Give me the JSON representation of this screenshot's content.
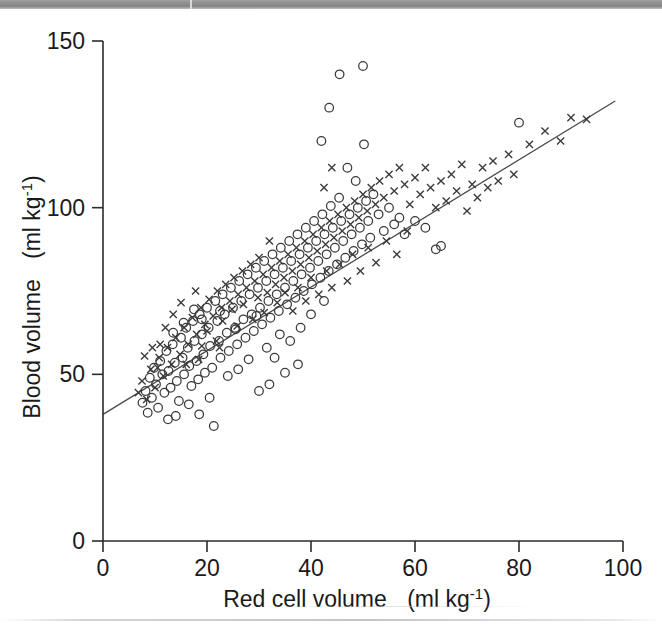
{
  "figure": {
    "background_color": "#ffffff",
    "ink_color": "#2b2b2b"
  },
  "chart_data": {
    "type": "scatter",
    "title": "",
    "xlabel": "Red cell volume",
    "xunits": "(ml kg⁻¹)",
    "ylabel": "Blood volume",
    "yunits": "(ml kg⁻¹)",
    "xlim": [
      0,
      100
    ],
    "ylim": [
      0,
      150
    ],
    "xticks": [
      0,
      20,
      40,
      60,
      80,
      100
    ],
    "yticks": [
      0,
      50,
      100,
      150
    ],
    "xticklabels": [
      "0",
      "20",
      "40",
      "60",
      "80",
      "100"
    ],
    "yticklabels": [
      "0",
      "50",
      "100",
      "150"
    ],
    "grid": false,
    "legend": "none",
    "fit_line": {
      "label": "regression line",
      "color": "#4a4a4a",
      "x_start": 0.0,
      "y_start": 38.0,
      "x_end": 98.5,
      "y_end": 132.0
    },
    "series": [
      {
        "name": "open-circle group",
        "marker": "o",
        "color": "#3a3a3a",
        "points": [
          [
            7.6,
            41.5
          ],
          [
            8.2,
            45.0
          ],
          [
            8.6,
            38.5
          ],
          [
            9.0,
            49.0
          ],
          [
            9.4,
            43.0
          ],
          [
            9.8,
            52.0
          ],
          [
            10.2,
            47.0
          ],
          [
            10.6,
            40.0
          ],
          [
            11.0,
            54.0
          ],
          [
            11.4,
            50.0
          ],
          [
            11.8,
            44.5
          ],
          [
            12.2,
            57.0
          ],
          [
            12.6,
            51.0
          ],
          [
            13.0,
            46.0
          ],
          [
            13.4,
            59.0
          ],
          [
            13.8,
            53.5
          ],
          [
            14.2,
            48.0
          ],
          [
            14.6,
            42.0
          ],
          [
            15.0,
            61.0
          ],
          [
            15.3,
            55.0
          ],
          [
            15.6,
            50.0
          ],
          [
            16.0,
            64.0
          ],
          [
            16.3,
            58.0
          ],
          [
            16.6,
            52.5
          ],
          [
            17.0,
            46.5
          ],
          [
            17.3,
            66.0
          ],
          [
            17.6,
            60.0
          ],
          [
            18.0,
            54.0
          ],
          [
            18.3,
            48.5
          ],
          [
            18.6,
            68.0
          ],
          [
            19.0,
            62.0
          ],
          [
            19.3,
            56.0
          ],
          [
            19.6,
            50.5
          ],
          [
            20.0,
            70.0
          ],
          [
            20.3,
            64.0
          ],
          [
            20.6,
            58.5
          ],
          [
            21.0,
            52.0
          ],
          [
            21.3,
            34.5
          ],
          [
            21.6,
            72.0
          ],
          [
            22.0,
            66.0
          ],
          [
            22.3,
            60.0
          ],
          [
            22.6,
            55.0
          ],
          [
            23.0,
            74.0
          ],
          [
            23.4,
            68.0
          ],
          [
            23.8,
            62.5
          ],
          [
            24.2,
            57.0
          ],
          [
            24.6,
            76.0
          ],
          [
            25.0,
            70.0
          ],
          [
            25.4,
            64.0
          ],
          [
            25.8,
            59.0
          ],
          [
            26.2,
            78.0
          ],
          [
            26.6,
            72.0
          ],
          [
            27.0,
            66.5
          ],
          [
            27.4,
            61.0
          ],
          [
            27.8,
            80.0
          ],
          [
            28.2,
            74.0
          ],
          [
            28.6,
            68.0
          ],
          [
            29.0,
            63.0
          ],
          [
            29.4,
            82.0
          ],
          [
            29.8,
            76.0
          ],
          [
            30.2,
            70.0
          ],
          [
            30.6,
            65.0
          ],
          [
            31.0,
            84.0
          ],
          [
            31.4,
            78.0
          ],
          [
            31.8,
            72.0
          ],
          [
            32.2,
            67.0
          ],
          [
            32.6,
            86.0
          ],
          [
            33.0,
            80.0
          ],
          [
            33.4,
            74.0
          ],
          [
            33.8,
            69.0
          ],
          [
            34.2,
            88.0
          ],
          [
            34.6,
            82.0
          ],
          [
            35.0,
            76.0
          ],
          [
            35.4,
            71.0
          ],
          [
            35.8,
            90.0
          ],
          [
            36.2,
            84.0
          ],
          [
            36.6,
            78.0
          ],
          [
            37.0,
            73.0
          ],
          [
            37.4,
            92.0
          ],
          [
            37.8,
            86.0
          ],
          [
            38.2,
            80.0
          ],
          [
            38.6,
            75.0
          ],
          [
            39.0,
            94.0
          ],
          [
            39.4,
            88.0
          ],
          [
            39.8,
            82.0
          ],
          [
            40.2,
            77.0
          ],
          [
            40.6,
            96.0
          ],
          [
            41.0,
            90.0
          ],
          [
            41.4,
            84.0
          ],
          [
            41.8,
            79.0
          ],
          [
            42.2,
            98.0
          ],
          [
            42.6,
            92.0
          ],
          [
            43.0,
            86.0
          ],
          [
            43.4,
            81.0
          ],
          [
            43.8,
            100.5
          ],
          [
            44.2,
            94.0
          ],
          [
            44.6,
            88.0
          ],
          [
            45.0,
            83.0
          ],
          [
            45.4,
            103.0
          ],
          [
            45.8,
            96.0
          ],
          [
            46.2,
            90.0
          ],
          [
            46.6,
            85.0
          ],
          [
            47.0,
            112.0
          ],
          [
            47.4,
            98.0
          ],
          [
            47.8,
            92.0
          ],
          [
            48.2,
            87.0
          ],
          [
            48.6,
            108.0
          ],
          [
            49.0,
            100.0
          ],
          [
            49.4,
            94.0
          ],
          [
            49.8,
            89.0
          ],
          [
            50.2,
            119.0
          ],
          [
            50.6,
            102.0
          ],
          [
            51.0,
            96.0
          ],
          [
            51.4,
            91.0
          ],
          [
            45.5,
            140.0
          ],
          [
            50.0,
            142.5
          ],
          [
            43.5,
            130.0
          ],
          [
            42.0,
            120.0
          ],
          [
            52.0,
            104.0
          ],
          [
            53.0,
            98.0
          ],
          [
            54.0,
            93.0
          ],
          [
            55.0,
            100.0
          ],
          [
            56.0,
            95.0
          ],
          [
            57.0,
            97.0
          ],
          [
            58.0,
            92.0
          ],
          [
            60.0,
            96.0
          ],
          [
            62.0,
            94.0
          ],
          [
            64.0,
            87.5
          ],
          [
            65.0,
            88.5
          ],
          [
            80.0,
            125.5
          ],
          [
            14.0,
            37.5
          ],
          [
            12.5,
            36.5
          ],
          [
            16.5,
            41.0
          ],
          [
            18.5,
            38.0
          ],
          [
            20.5,
            43.0
          ],
          [
            24.0,
            49.5
          ],
          [
            26.0,
            51.5
          ],
          [
            28.0,
            54.5
          ],
          [
            31.5,
            58.0
          ],
          [
            34.0,
            62.0
          ],
          [
            19.0,
            66.5
          ],
          [
            22.5,
            69.0
          ],
          [
            25.5,
            63.5
          ],
          [
            29.5,
            67.5
          ],
          [
            13.5,
            62.5
          ],
          [
            15.5,
            65.5
          ],
          [
            17.5,
            69.5
          ],
          [
            33.0,
            55.0
          ],
          [
            36.0,
            60.0
          ],
          [
            38.0,
            64.0
          ],
          [
            40.0,
            68.0
          ],
          [
            42.5,
            72.0
          ],
          [
            35.0,
            50.5
          ],
          [
            37.5,
            53.0
          ],
          [
            30.0,
            45.0
          ],
          [
            32.0,
            47.0
          ]
        ]
      },
      {
        "name": "cross group",
        "marker": "x",
        "color": "#3a3a3a",
        "points": [
          [
            6.8,
            44.5
          ],
          [
            7.5,
            48.0
          ],
          [
            8.4,
            42.5
          ],
          [
            9.2,
            51.5
          ],
          [
            10.0,
            46.0
          ],
          [
            10.8,
            55.0
          ],
          [
            11.6,
            49.5
          ],
          [
            12.4,
            58.0
          ],
          [
            13.2,
            53.0
          ],
          [
            14.0,
            61.0
          ],
          [
            14.8,
            56.0
          ],
          [
            15.6,
            64.0
          ],
          [
            16.4,
            59.0
          ],
          [
            17.2,
            67.0
          ],
          [
            18.0,
            62.0
          ],
          [
            18.8,
            70.0
          ],
          [
            19.6,
            65.0
          ],
          [
            20.4,
            72.5
          ],
          [
            21.2,
            67.5
          ],
          [
            22.0,
            75.0
          ],
          [
            22.8,
            70.0
          ],
          [
            23.6,
            77.0
          ],
          [
            24.4,
            72.0
          ],
          [
            25.2,
            79.0
          ],
          [
            26.0,
            74.0
          ],
          [
            26.8,
            81.0
          ],
          [
            27.6,
            76.0
          ],
          [
            28.4,
            83.0
          ],
          [
            29.2,
            78.0
          ],
          [
            30.0,
            85.0
          ],
          [
            30.8,
            80.0
          ],
          [
            31.6,
            74.5
          ],
          [
            32.4,
            82.0
          ],
          [
            33.2,
            77.0
          ],
          [
            34.0,
            84.0
          ],
          [
            34.8,
            79.0
          ],
          [
            35.6,
            86.0
          ],
          [
            36.4,
            81.0
          ],
          [
            37.2,
            88.0
          ],
          [
            38.0,
            83.0
          ],
          [
            38.8,
            90.0
          ],
          [
            39.6,
            85.0
          ],
          [
            40.4,
            92.0
          ],
          [
            41.2,
            87.0
          ],
          [
            42.0,
            94.0
          ],
          [
            42.8,
            89.0
          ],
          [
            43.6,
            96.0
          ],
          [
            44.4,
            91.0
          ],
          [
            45.2,
            98.0
          ],
          [
            46.0,
            93.0
          ],
          [
            46.8,
            100.0
          ],
          [
            47.6,
            95.0
          ],
          [
            48.4,
            102.0
          ],
          [
            49.2,
            97.0
          ],
          [
            50.0,
            104.0
          ],
          [
            50.8,
            99.0
          ],
          [
            51.6,
            106.0
          ],
          [
            52.4,
            101.0
          ],
          [
            53.2,
            108.0
          ],
          [
            54.0,
            103.0
          ],
          [
            55.0,
            110.0
          ],
          [
            56.0,
            105.0
          ],
          [
            57.0,
            112.0
          ],
          [
            58.0,
            107.0
          ],
          [
            59.0,
            101.0
          ],
          [
            60.0,
            109.0
          ],
          [
            61.0,
            104.0
          ],
          [
            62.0,
            112.0
          ],
          [
            63.0,
            106.0
          ],
          [
            64.0,
            100.0
          ],
          [
            65.0,
            108.0
          ],
          [
            66.0,
            102.0
          ],
          [
            67.0,
            110.0
          ],
          [
            68.0,
            105.0
          ],
          [
            69.0,
            113.0
          ],
          [
            70.0,
            99.0
          ],
          [
            71.0,
            107.0
          ],
          [
            72.0,
            103.0
          ],
          [
            73.0,
            112.0
          ],
          [
            74.0,
            106.0
          ],
          [
            75.0,
            114.0
          ],
          [
            76.0,
            108.0
          ],
          [
            78.0,
            116.0
          ],
          [
            79.0,
            110.0
          ],
          [
            82.0,
            119.0
          ],
          [
            85.0,
            123.0
          ],
          [
            88.0,
            120.0
          ],
          [
            90.0,
            127.0
          ],
          [
            93.0,
            126.5
          ],
          [
            11.0,
            59.0
          ],
          [
            12.0,
            64.0
          ],
          [
            13.5,
            68.0
          ],
          [
            16.0,
            53.0
          ],
          [
            17.8,
            75.0
          ],
          [
            19.0,
            58.5
          ],
          [
            20.0,
            63.0
          ],
          [
            21.8,
            60.0
          ],
          [
            23.0,
            66.0
          ],
          [
            24.8,
            69.5
          ],
          [
            25.8,
            64.5
          ],
          [
            27.0,
            71.0
          ],
          [
            28.8,
            66.5
          ],
          [
            29.8,
            73.0
          ],
          [
            31.0,
            68.5
          ],
          [
            32.0,
            90.0
          ],
          [
            33.5,
            71.5
          ],
          [
            35.0,
            74.5
          ],
          [
            36.5,
            69.0
          ],
          [
            37.5,
            76.0
          ],
          [
            39.0,
            72.0
          ],
          [
            40.0,
            79.0
          ],
          [
            41.5,
            74.0
          ],
          [
            43.0,
            81.0
          ],
          [
            44.0,
            76.0
          ],
          [
            45.5,
            83.0
          ],
          [
            47.0,
            78.0
          ],
          [
            48.0,
            86.0
          ],
          [
            49.5,
            81.0
          ],
          [
            51.0,
            88.0
          ],
          [
            52.5,
            83.5
          ],
          [
            54.5,
            90.0
          ],
          [
            56.5,
            86.0
          ],
          [
            58.5,
            93.0
          ],
          [
            44.0,
            112.0
          ],
          [
            42.5,
            106.0
          ],
          [
            8.0,
            55.5
          ],
          [
            9.5,
            58.0
          ],
          [
            10.5,
            52.0
          ],
          [
            15.0,
            71.5
          ],
          [
            18.4,
            54.5
          ],
          [
            22.4,
            58.0
          ]
        ]
      }
    ]
  }
}
